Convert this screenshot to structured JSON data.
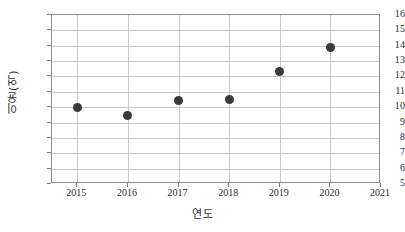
{
  "chart_data": {
    "type": "scatter",
    "title": "",
    "xlabel": "연도",
    "ylabel": "이윤(억)",
    "x": [
      2015,
      2016,
      2017,
      2018,
      2019,
      2020
    ],
    "values": [
      10.0,
      9.45,
      10.45,
      10.5,
      12.3,
      13.9
    ],
    "series": [
      {
        "name": "이윤(억)",
        "points": [
          {
            "x": 2015,
            "y": 10.0
          },
          {
            "x": 2016,
            "y": 9.45
          },
          {
            "x": 2017,
            "y": 10.45
          },
          {
            "x": 2018,
            "y": 10.5
          },
          {
            "x": 2019,
            "y": 12.3
          },
          {
            "x": 2020,
            "y": 13.9
          }
        ]
      }
    ],
    "xlim": [
      2014.5,
      2021.0
    ],
    "ylim": [
      5,
      16
    ],
    "xticks": [
      2015,
      2016,
      2017,
      2018,
      2019,
      2020,
      2021
    ],
    "xtick_labels": [
      "2015",
      "2016",
      "2017",
      "2018",
      "2019",
      "2020",
      "2021"
    ],
    "yticks": [
      5,
      6,
      7,
      8,
      9,
      10,
      11,
      12,
      13,
      14,
      15,
      16
    ],
    "ytick_labels": [
      "5",
      "6",
      "7",
      "8",
      "9",
      "10",
      "11",
      "12",
      "13",
      "14",
      "15",
      "16"
    ],
    "grid": true,
    "legend": false,
    "marker_color": "#3a3a3a",
    "grid_color": "#c9c9c9",
    "axis_color": "#8c8c8c",
    "background_color": "#ffffff"
  }
}
